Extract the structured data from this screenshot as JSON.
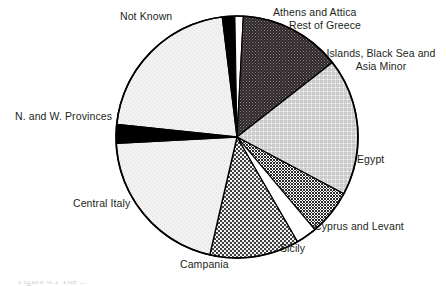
{
  "chart_data": {
    "type": "pie",
    "title": "",
    "xlabel": "",
    "ylabel": "",
    "legend_position": "none",
    "labels_position": "outside-callout",
    "grid": false,
    "center": {
      "x": 237,
      "y": 137
    },
    "radius": 121,
    "start_angle_deg": -97,
    "direction": "clockwise",
    "categories": [
      "Athens and Attica",
      "Rest of Greece",
      "Islands, Black Sea and Asia Minor",
      "Egypt",
      "Cyprus and Levant",
      "Sicily",
      "Campania",
      "Central Italy",
      "N. and W. Provinces",
      "Not Known"
    ],
    "values": [
      1.7,
      1.1,
      13.6,
      18.3,
      6.1,
      2.8,
      11.9,
      20.6,
      2.5,
      21.4
    ],
    "slices": [
      {
        "label": "Athens and Attica",
        "value": 1.7,
        "start_angle": -97,
        "end_angle": -91,
        "fill": "solid-black",
        "color": "#000000"
      },
      {
        "label": "Rest of Greece",
        "value": 1.1,
        "start_angle": -91,
        "end_angle": -87,
        "fill": "white",
        "color": "#ffffff"
      },
      {
        "label": "Islands, Black Sea and Asia Minor",
        "value": 13.6,
        "start_angle": -87,
        "end_angle": -38,
        "fill": "dark-stipple",
        "color": "#3a3336"
      },
      {
        "label": "Egypt",
        "value": 18.3,
        "start_angle": -38,
        "end_angle": 28,
        "fill": "light-crosshatch",
        "color": "#d9d9d9"
      },
      {
        "label": "Cyprus and Levant",
        "value": 6.1,
        "start_angle": 28,
        "end_angle": 50,
        "fill": "dense-dot",
        "color": "#58585a"
      },
      {
        "label": "Sicily",
        "value": 2.8,
        "start_angle": 50,
        "end_angle": 60,
        "fill": "white",
        "color": "#ffffff"
      },
      {
        "label": "Campania",
        "value": 11.9,
        "start_angle": 60,
        "end_angle": 103,
        "fill": "medium-dot",
        "color": "#6e6e70"
      },
      {
        "label": "Central Italy",
        "value": 20.6,
        "start_angle": 103,
        "end_angle": 177,
        "fill": "very-light",
        "color": "#efefef"
      },
      {
        "label": "N. and W. Provinces",
        "value": 2.5,
        "start_angle": 177,
        "end_angle": 186,
        "fill": "solid-black",
        "color": "#000000"
      },
      {
        "label": "Not Known",
        "value": 21.4,
        "start_angle": 186,
        "end_angle": 263,
        "fill": "very-light",
        "color": "#efefef"
      }
    ],
    "outline_color": "#000000"
  },
  "labels": {
    "not_known": "Not Known",
    "athens_and_attica": "Athens and Attica",
    "rest_of_greece": "Rest of Greece",
    "islands_black_sea": "Islands, Black Sea and Asia Minor",
    "egypt": "Egypt",
    "cyprus_and_levant": "Cyprus and Levant",
    "sicily": "Sicily",
    "campania": "Campania",
    "central_italy": "Central Italy",
    "nw_provinces": "N. and W. Provinces"
  },
  "caption": {
    "clipped_text": "Figure 4.1  The ..."
  }
}
